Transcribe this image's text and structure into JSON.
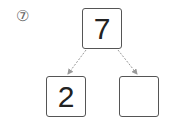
{
  "problem": {
    "number_label": "⑦",
    "top_value": "7",
    "bottom_left_value": "2",
    "bottom_right_value": ""
  },
  "colors": {
    "box_border": "#555555",
    "arrow": "#999999",
    "text": "#222222"
  }
}
